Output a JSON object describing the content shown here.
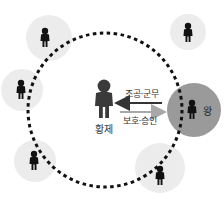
{
  "diagram": {
    "center": {
      "label": "황제",
      "role": "emperor"
    },
    "highlighted_node": {
      "label": "왕",
      "role": "king"
    },
    "arrows": [
      {
        "label": "조공·군무",
        "direction": "king-to-emperor",
        "color": "#333333"
      },
      {
        "label": "보호·승인",
        "direction": "emperor-to-king",
        "color": "#a8a8a8"
      }
    ],
    "peripheral_nodes_count": 5,
    "colors": {
      "peripheral_circle": "#ececec",
      "king_circle": "#9a9a9a",
      "figure": "#111111",
      "emperor_figure": "#3a3a3a",
      "dashed_ring": "#111111",
      "text": "#333333"
    }
  }
}
